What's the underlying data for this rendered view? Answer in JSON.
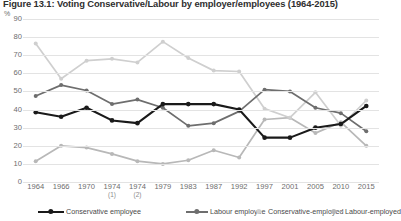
{
  "title": "Figure 13.1: Voting Conservative/Labour by employer/employees (1964-2015)",
  "axis": {
    "y_unit": "%",
    "y_ticks": [
      "90",
      "80",
      "70",
      "60",
      "50",
      "40",
      "30",
      "20",
      "10",
      "0"
    ]
  },
  "chart_data": {
    "type": "line",
    "title": "Figure 13.1: Voting Conservative/Labour by employer/employees (1964-2015)",
    "xlabel": "",
    "ylabel": "%",
    "ylim": [
      0,
      90
    ],
    "grid": true,
    "legend_position": "bottom",
    "categories": [
      "1964",
      "1966",
      "1970",
      "1974",
      "1974",
      "1979",
      "1983",
      "1987",
      "1992",
      "1997",
      "2001",
      "2005",
      "2010",
      "2015"
    ],
    "category_notes": [
      "",
      "",
      "",
      "(1)",
      "(2)",
      "",
      "",
      "",
      "",
      "",
      "",
      "",
      "",
      ""
    ],
    "series": [
      {
        "name": "Conservative employee",
        "color": "#1a1a1a",
        "style": "solid",
        "values": [
          38.5,
          36,
          41,
          34,
          32.5,
          43,
          43,
          43,
          40,
          24.5,
          24.5,
          30,
          32,
          42
        ]
      },
      {
        "name": "Labour employee",
        "color": "#6e6e6e",
        "style": "solid",
        "values": [
          47.5,
          53.5,
          50.5,
          43,
          45.5,
          41,
          31,
          32.5,
          39,
          51,
          50,
          41,
          38,
          28
        ]
      },
      {
        "name": "Conservative-employed",
        "color": "#cfcfcf",
        "style": "solid",
        "values": [
          76.5,
          57,
          67,
          68,
          66,
          77.5,
          68.5,
          61.5,
          61,
          40.5,
          35.5,
          49.5,
          31,
          45
        ]
      },
      {
        "name": "Labour-employed",
        "color": "#b8b8b8",
        "style": "solid",
        "values": [
          11.5,
          20,
          19,
          15.5,
          11.5,
          10,
          12,
          17.5,
          13.5,
          34.5,
          35.5,
          27,
          33,
          20
        ]
      }
    ]
  }
}
